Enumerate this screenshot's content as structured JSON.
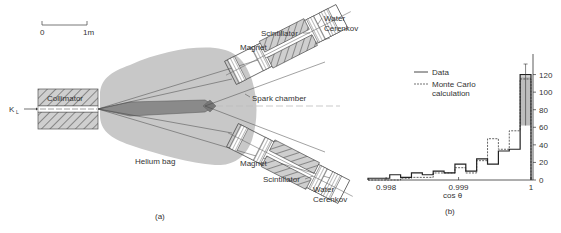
{
  "figure_a": {
    "panel_label": "(a)",
    "scale_bar": {
      "start_label": "0",
      "end_label": "1m"
    },
    "beam_label": "K",
    "beam_subscript": "L",
    "labels": {
      "collimator": "Collimator",
      "helium_bag": "Helium bag",
      "spark_chamber": "Spark chamber",
      "magnet_top": "Magnet",
      "magnet_bottom": "Magnet",
      "scintillator_top": "Scintillator",
      "scintillator_bottom": "Scintillator",
      "water_top": "Water",
      "cerenkov_top": "Cerenkov",
      "water_bottom": "Water",
      "cerenkov_bottom": "Cerenkov"
    },
    "colors": {
      "helium": "#c8c8c8",
      "hatch": "#777777",
      "beam_core": "#8a8a8a"
    }
  },
  "chart_data": {
    "type": "bar",
    "panel_label": "(b)",
    "title": "",
    "xlabel": "cos θ",
    "ylabel": "",
    "xlim": [
      0.99775,
      1.0
    ],
    "ylim": [
      0,
      140
    ],
    "x_ticks": [
      {
        "value": 0.998,
        "label": "0.998"
      },
      {
        "value": 0.999,
        "label": "0.999"
      },
      {
        "value": 1.0,
        "label": "1"
      }
    ],
    "y_ticks": [
      {
        "value": 0,
        "label": "0"
      },
      {
        "value": 20,
        "label": "20"
      },
      {
        "value": 40,
        "label": "40"
      },
      {
        "value": 60,
        "label": "60"
      },
      {
        "value": 80,
        "label": "80"
      },
      {
        "value": 100,
        "label": "100"
      },
      {
        "value": 120,
        "label": "120"
      }
    ],
    "bin_edges": [
      0.99775,
      0.9979,
      0.99805,
      0.9982,
      0.99835,
      0.9985,
      0.99865,
      0.9988,
      0.99895,
      0.9991,
      0.99925,
      0.9994,
      0.99955,
      0.9997,
      0.99985,
      1.0
    ],
    "legend": {
      "position": "top-left",
      "entries": [
        "Data",
        "Monte Carlo calculation"
      ]
    },
    "series": [
      {
        "name": "Data",
        "style": "solid",
        "values": [
          2,
          2,
          6,
          3,
          8,
          6,
          10,
          8,
          18,
          10,
          24,
          18,
          33,
          35,
          120
        ]
      },
      {
        "name": "Monte Carlo calculation",
        "style": "dashed",
        "values": [
          0,
          0,
          0,
          2,
          3,
          3,
          8,
          8,
          14,
          8,
          22,
          47,
          35,
          56,
          115
        ]
      }
    ],
    "last_bin_band": {
      "low": 62,
      "high": 118
    }
  }
}
